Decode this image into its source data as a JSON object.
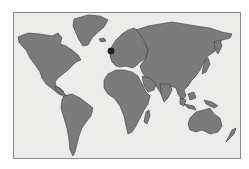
{
  "map": {
    "type": "world-outline",
    "colors": {
      "land": "#7b7b7b",
      "outline": "#3a3a3a",
      "background": "#ececea",
      "frame_border": "#8a8a8a",
      "marker": "#222222"
    },
    "continents": [
      "North America",
      "Greenland",
      "South America",
      "Europe",
      "Africa",
      "Asia",
      "Australia",
      "New Zealand",
      "Madagascar",
      "Japan",
      "Indonesia",
      "New Guinea"
    ],
    "marker": {
      "location": "United Kingdom",
      "shape": "dark-circle"
    }
  }
}
